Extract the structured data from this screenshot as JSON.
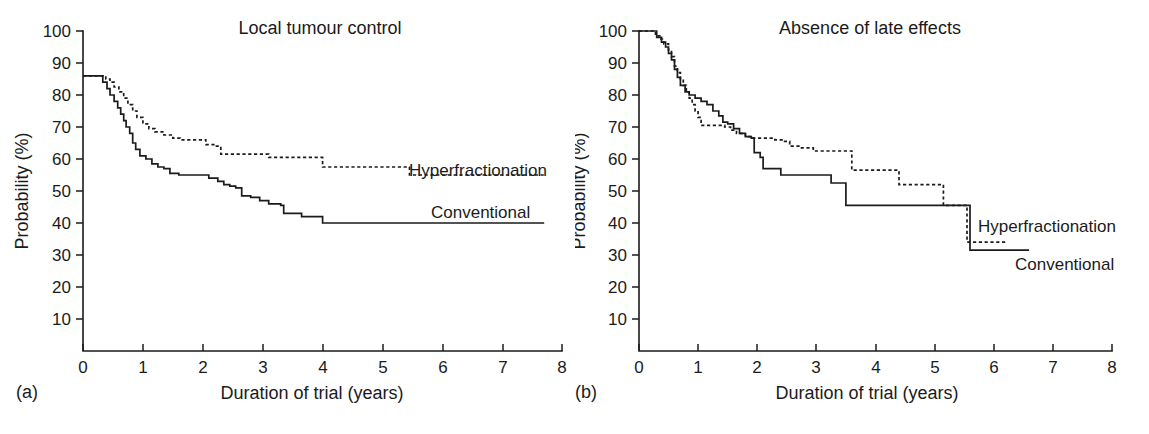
{
  "figure": {
    "background": "#ffffff",
    "ink_color": "#1b1b1b",
    "width": 1149,
    "height": 434
  },
  "panels": [
    {
      "tag": "(a)",
      "title": "Local tumour control",
      "xlabel": "Duration of trial (years)",
      "ylabel": "Probability (%)",
      "series_labels": {
        "hyperfractionation": "Hyperfractionation",
        "conventional": "Conventional"
      }
    },
    {
      "tag": "(b)",
      "title": "Absence of late effects",
      "xlabel": "Duration of trial (years)",
      "ylabel": "Probability (%)",
      "series_labels": {
        "hyperfractionation": "Hyperfractionation",
        "conventional": "Conventional"
      }
    }
  ],
  "axis": {
    "x_ticks": [
      "0",
      "1",
      "2",
      "3",
      "4",
      "5",
      "6",
      "7",
      "8"
    ],
    "y_ticks": [
      "100",
      "90",
      "80",
      "70",
      "60",
      "50",
      "40",
      "30",
      "20",
      "10"
    ]
  },
  "chart_data": [
    {
      "type": "line",
      "subtype": "kaplan-meier-step",
      "panel": "(a)",
      "title": "Local tumour control",
      "xlabel": "Duration of trial (years)",
      "ylabel": "Probability (%)",
      "xlim": [
        0,
        8
      ],
      "ylim": [
        0,
        100
      ],
      "x_ticks": [
        0,
        1,
        2,
        3,
        4,
        5,
        6,
        7,
        8
      ],
      "y_ticks": [
        10,
        20,
        30,
        40,
        50,
        60,
        70,
        80,
        90,
        100
      ],
      "grid": false,
      "legend": "inline-right",
      "series": [
        {
          "name": "Hyperfractionation",
          "style": "dashed",
          "points": [
            [
              0.0,
              86
            ],
            [
              0.3,
              86
            ],
            [
              0.38,
              85
            ],
            [
              0.45,
              84
            ],
            [
              0.52,
              82.5
            ],
            [
              0.6,
              81
            ],
            [
              0.68,
              79
            ],
            [
              0.75,
              77
            ],
            [
              0.83,
              75
            ],
            [
              0.9,
              73
            ],
            [
              1.0,
              71
            ],
            [
              1.1,
              69.5
            ],
            [
              1.2,
              68.5
            ],
            [
              1.35,
              67.5
            ],
            [
              1.5,
              66.5
            ],
            [
              1.62,
              66
            ],
            [
              1.95,
              66
            ],
            [
              2.05,
              64.5
            ],
            [
              2.2,
              64
            ],
            [
              2.3,
              61.5
            ],
            [
              2.6,
              61.5
            ],
            [
              3.0,
              61.5
            ],
            [
              3.1,
              60.5
            ],
            [
              3.5,
              60.5
            ],
            [
              3.9,
              60.5
            ],
            [
              4.0,
              57.5
            ],
            [
              4.6,
              57.5
            ],
            [
              5.4,
              57.5
            ],
            [
              5.45,
              55
            ],
            [
              7.7,
              55
            ]
          ]
        },
        {
          "name": "Conventional",
          "style": "solid",
          "points": [
            [
              0.0,
              86
            ],
            [
              0.28,
              86
            ],
            [
              0.33,
              84
            ],
            [
              0.4,
              82
            ],
            [
              0.45,
              80
            ],
            [
              0.52,
              78
            ],
            [
              0.58,
              76
            ],
            [
              0.63,
              74
            ],
            [
              0.68,
              72
            ],
            [
              0.72,
              70
            ],
            [
              0.78,
              68
            ],
            [
              0.83,
              65
            ],
            [
              0.88,
              63
            ],
            [
              0.95,
              61
            ],
            [
              1.05,
              60
            ],
            [
              1.15,
              58.5
            ],
            [
              1.25,
              57.5
            ],
            [
              1.35,
              57
            ],
            [
              1.45,
              55.5
            ],
            [
              1.6,
              55
            ],
            [
              1.95,
              55
            ],
            [
              2.1,
              54
            ],
            [
              2.25,
              53
            ],
            [
              2.35,
              52
            ],
            [
              2.45,
              51.5
            ],
            [
              2.55,
              51
            ],
            [
              2.65,
              48.5
            ],
            [
              2.8,
              48
            ],
            [
              2.95,
              47
            ],
            [
              3.1,
              46
            ],
            [
              3.3,
              45.5
            ],
            [
              3.35,
              43
            ],
            [
              3.6,
              43
            ],
            [
              3.65,
              42
            ],
            [
              3.95,
              42
            ],
            [
              4.0,
              40
            ],
            [
              5.0,
              40
            ],
            [
              6.5,
              40
            ],
            [
              7.7,
              40
            ]
          ]
        }
      ]
    },
    {
      "type": "line",
      "subtype": "kaplan-meier-step",
      "panel": "(b)",
      "title": "Absence of late effects",
      "xlabel": "Duration of trial (years)",
      "ylabel": "Probability (%)",
      "xlim": [
        0,
        8
      ],
      "ylim": [
        0,
        100
      ],
      "x_ticks": [
        0,
        1,
        2,
        3,
        4,
        5,
        6,
        7,
        8
      ],
      "y_ticks": [
        10,
        20,
        30,
        40,
        50,
        60,
        70,
        80,
        90,
        100
      ],
      "grid": false,
      "legend": "inline-right",
      "series": [
        {
          "name": "Hyperfractionation",
          "style": "dashed",
          "points": [
            [
              0.0,
              100
            ],
            [
              0.2,
              100
            ],
            [
              0.28,
              98.5
            ],
            [
              0.35,
              97.5
            ],
            [
              0.42,
              96
            ],
            [
              0.5,
              94
            ],
            [
              0.55,
              92
            ],
            [
              0.6,
              89
            ],
            [
              0.65,
              87
            ],
            [
              0.7,
              85
            ],
            [
              0.75,
              83
            ],
            [
              0.8,
              81
            ],
            [
              0.85,
              79
            ],
            [
              0.9,
              77
            ],
            [
              0.95,
              75
            ],
            [
              1.0,
              73
            ],
            [
              1.05,
              70.5
            ],
            [
              1.35,
              70.5
            ],
            [
              1.45,
              70
            ],
            [
              1.55,
              69
            ],
            [
              1.65,
              68
            ],
            [
              1.8,
              67
            ],
            [
              1.9,
              66.5
            ],
            [
              2.1,
              66.5
            ],
            [
              2.3,
              66
            ],
            [
              2.45,
              65.5
            ],
            [
              2.55,
              64
            ],
            [
              2.75,
              63.5
            ],
            [
              2.95,
              62.5
            ],
            [
              3.45,
              62.5
            ],
            [
              3.6,
              56.5
            ],
            [
              4.3,
              56.5
            ],
            [
              4.4,
              52
            ],
            [
              5.1,
              52
            ],
            [
              5.15,
              45.5
            ],
            [
              5.5,
              45.5
            ],
            [
              5.55,
              34
            ],
            [
              6.2,
              34
            ]
          ]
        },
        {
          "name": "Conventional",
          "style": "solid",
          "points": [
            [
              0.0,
              100
            ],
            [
              0.25,
              100
            ],
            [
              0.3,
              98
            ],
            [
              0.38,
              96.5
            ],
            [
              0.45,
              95
            ],
            [
              0.5,
              93
            ],
            [
              0.55,
              91
            ],
            [
              0.6,
              88
            ],
            [
              0.65,
              85.5
            ],
            [
              0.7,
              83
            ],
            [
              0.78,
              81
            ],
            [
              0.85,
              80
            ],
            [
              0.95,
              79
            ],
            [
              1.05,
              78
            ],
            [
              1.15,
              77
            ],
            [
              1.25,
              75
            ],
            [
              1.35,
              73.5
            ],
            [
              1.42,
              71.5
            ],
            [
              1.5,
              71
            ],
            [
              1.6,
              69.5
            ],
            [
              1.7,
              68
            ],
            [
              1.8,
              67
            ],
            [
              1.9,
              66.5
            ],
            [
              1.95,
              62
            ],
            [
              2.05,
              60.5
            ],
            [
              2.1,
              57
            ],
            [
              2.3,
              57
            ],
            [
              2.4,
              55
            ],
            [
              3.15,
              55
            ],
            [
              3.25,
              52.5
            ],
            [
              3.45,
              52.5
            ],
            [
              3.5,
              45.5
            ],
            [
              4.3,
              45.5
            ],
            [
              5.0,
              45.5
            ],
            [
              5.5,
              45.5
            ],
            [
              5.6,
              31.5
            ],
            [
              6.6,
              31.5
            ]
          ]
        }
      ]
    }
  ]
}
